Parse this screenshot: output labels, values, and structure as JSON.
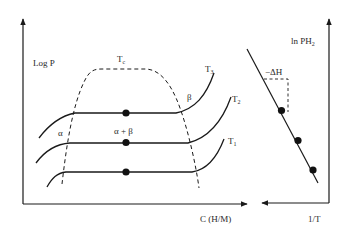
{
  "left_plot": {
    "y_axis_label": "Log P",
    "x_axis_label": "C (H/M)",
    "dome_label": "T",
    "dome_label_sub": "c",
    "alpha_label": "α",
    "beta_label": "β",
    "two_phase_label": "α + β",
    "isotherms": [
      {
        "name": "T",
        "sub": "3"
      },
      {
        "name": "T",
        "sub": "2"
      },
      {
        "name": "T",
        "sub": "1"
      }
    ]
  },
  "right_plot": {
    "y_axis_label": "ln PH",
    "y_axis_label_sub": "2",
    "x_axis_label": "1/T",
    "slope_label": "−ΔH"
  },
  "colors": {
    "line": "#1a1a1a",
    "text": "#2a2a2a",
    "background": "#ffffff"
  }
}
